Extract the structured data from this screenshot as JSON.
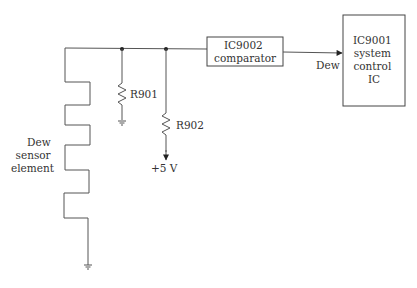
{
  "diagram": {
    "type": "circuit-schematic",
    "colors": {
      "line": "#555555",
      "text": "#333333",
      "background": "#ffffff"
    },
    "components": {
      "sensor": {
        "label_lines": [
          "Dew",
          "sensor",
          "element"
        ]
      },
      "r901": {
        "label": "R901"
      },
      "r902": {
        "label": "R902"
      },
      "supply": {
        "label": "+5 V"
      },
      "comparator": {
        "label_lines": [
          "IC9002",
          "comparator"
        ]
      },
      "system_ic": {
        "label_lines": [
          "IC9001",
          "system",
          "control",
          "IC"
        ]
      },
      "signal": {
        "label": "Dew"
      }
    }
  }
}
